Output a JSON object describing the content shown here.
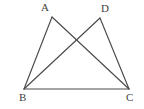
{
  "figure": {
    "kind": "geometry-diagram",
    "background_color": "#ffffff",
    "line_color": "#4a4a4a",
    "label_color": "#3f3f3f",
    "line_width": 1.15,
    "canvas": {
      "width": 144,
      "height": 109
    },
    "points": [
      {
        "id": "A",
        "label": "A",
        "x": 52,
        "y": 17,
        "label_x": 41,
        "label_y": 2
      },
      {
        "id": "D",
        "label": "D",
        "x": 100,
        "y": 18,
        "label_x": 101,
        "label_y": 3
      },
      {
        "id": "B",
        "label": "B",
        "x": 24,
        "y": 89,
        "label_x": 19,
        "label_y": 92
      },
      {
        "id": "C",
        "label": "C",
        "x": 129,
        "y": 89,
        "label_x": 126,
        "label_y": 92
      }
    ],
    "segments": [
      {
        "id": "AB",
        "from": "A",
        "to": "B",
        "x1": 52,
        "y1": 17,
        "x2": 24,
        "y2": 89
      },
      {
        "id": "AC",
        "from": "A",
        "to": "C",
        "x1": 52,
        "y1": 17,
        "x2": 129,
        "y2": 89
      },
      {
        "id": "DB",
        "from": "D",
        "to": "B",
        "x1": 100,
        "y1": 18,
        "x2": 24,
        "y2": 89
      },
      {
        "id": "DC",
        "from": "D",
        "to": "C",
        "x1": 100,
        "y1": 18,
        "x2": 129,
        "y2": 89
      },
      {
        "id": "BC",
        "from": "B",
        "to": "C",
        "x1": 24,
        "y1": 89,
        "x2": 129,
        "y2": 89
      }
    ],
    "intersection": {
      "id": "AC-BD",
      "x": 78,
      "y": 45
    }
  }
}
